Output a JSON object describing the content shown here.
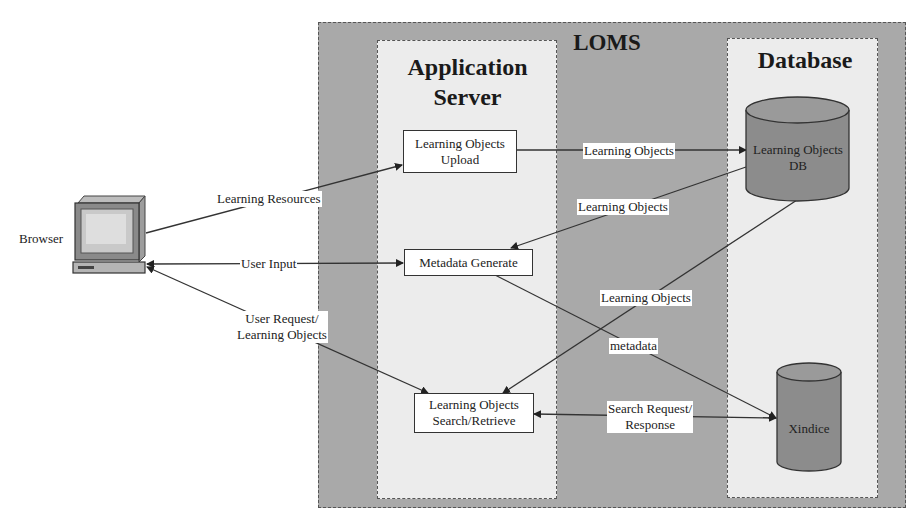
{
  "diagram": {
    "system_title": "LOMS",
    "panels": {
      "app_server": {
        "title_line1": "Application",
        "title_line2": "Server"
      },
      "database": {
        "title": "Database"
      }
    },
    "client": {
      "label": "Browser",
      "icon": "computer-icon"
    },
    "components": {
      "upload": {
        "line1": "Learning Objects",
        "line2": "Upload"
      },
      "metadata": {
        "label": "Metadata Generate"
      },
      "search": {
        "line1": "Learning Objects",
        "line2": "Search/Retrieve"
      }
    },
    "stores": {
      "lo_db": {
        "line1": "Learning Objects",
        "line2": "DB"
      },
      "xindice": {
        "label": "Xindice"
      }
    },
    "edges": {
      "learning_resources": "Learning Resources",
      "user_input": "User Input",
      "user_request_line1": "User Request/",
      "user_request_line2": "Learning Objects",
      "upload_to_db": "Learning Objects",
      "db_to_metadata": "Learning Objects",
      "db_to_search": "Learning Objects",
      "metadata_to_xindice": "metadata",
      "search_xindice_line1": "Search Request/",
      "search_xindice_line2": "Response"
    },
    "colors": {
      "outer_fill": "#a9a9a9",
      "panel_fill": "#ececec",
      "cylinder_fill": "#8c8c8c",
      "line": "#333333"
    }
  }
}
